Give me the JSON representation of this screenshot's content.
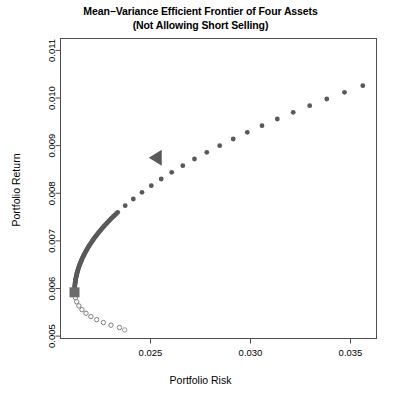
{
  "chart_data": {
    "type": "scatter",
    "title_line1": "Mean−Variance Efficient Frontier of Four Assets",
    "title_line2": "(Not Allowing Short Selling)",
    "xlabel": "Portfolio Risk",
    "ylabel": "Portfolio Return",
    "xlim": [
      0.0205,
      0.0363
    ],
    "ylim": [
      0.00495,
      0.01125
    ],
    "xticks": [
      0.025,
      0.03,
      0.035
    ],
    "xtick_labels": [
      "0.025",
      "0.030",
      "0.035"
    ],
    "yticks": [
      0.005,
      0.006,
      0.007,
      0.008,
      0.009,
      0.01,
      0.011
    ],
    "ytick_labels": [
      "0.005",
      "0.006",
      "0.007",
      "0.008",
      "0.009",
      "0.010",
      "0.011"
    ],
    "grid": false,
    "legend": "none",
    "marker_color": "#595959",
    "frame_color": "#4d4d4d",
    "series": [
      {
        "name": "Efficient frontier",
        "marker": "filled-circle",
        "color": "#595959",
        "points": [
          [
            0.0212,
            0.00592
          ],
          [
            0.021215,
            0.00606
          ],
          [
            0.02126,
            0.0062
          ],
          [
            0.021335,
            0.00634
          ],
          [
            0.02144,
            0.00648
          ],
          [
            0.021575,
            0.00662
          ],
          [
            0.02174,
            0.00676
          ],
          [
            0.021935,
            0.0069
          ],
          [
            0.02216,
            0.00704
          ],
          [
            0.022415,
            0.00718
          ],
          [
            0.0227,
            0.00732
          ],
          [
            0.023015,
            0.00746
          ],
          [
            0.02336,
            0.0076
          ],
          [
            0.023735,
            0.00774
          ],
          [
            0.02414,
            0.00788
          ],
          [
            0.024575,
            0.00802
          ],
          [
            0.02504,
            0.00816
          ],
          [
            0.025535,
            0.0083
          ],
          [
            0.02606,
            0.00844
          ],
          [
            0.026615,
            0.00858
          ],
          [
            0.0272,
            0.00872
          ],
          [
            0.027815,
            0.00886
          ],
          [
            0.02846,
            0.009
          ],
          [
            0.029135,
            0.00914
          ],
          [
            0.02984,
            0.00928
          ],
          [
            0.030575,
            0.00942
          ],
          [
            0.03134,
            0.00956
          ],
          [
            0.032135,
            0.0097
          ],
          [
            0.03296,
            0.00984
          ],
          [
            0.033815,
            0.00998
          ],
          [
            0.0347,
            0.01012
          ],
          [
            0.035615,
            0.01026
          ]
        ]
      },
      {
        "name": "Inefficient lower branch",
        "marker": "open-circle",
        "color": "#808080",
        "points": [
          [
            0.021245,
            0.00581
          ],
          [
            0.02131,
            0.00572
          ],
          [
            0.02142,
            0.005635
          ],
          [
            0.021575,
            0.005555
          ],
          [
            0.021775,
            0.00548
          ],
          [
            0.02202,
            0.00541
          ],
          [
            0.02231,
            0.005345
          ],
          [
            0.022645,
            0.005285
          ],
          [
            0.023025,
            0.00523
          ],
          [
            0.02345,
            0.00518
          ]
        ]
      },
      {
        "name": "Isolated asset point",
        "marker": "open-circle",
        "color": "#9a9a9a",
        "points": [
          [
            0.02371,
            0.00513
          ]
        ]
      }
    ],
    "annotations": [
      {
        "name": "minimum-variance-portfolio",
        "marker": "filled-square",
        "color": "#6b6b6b",
        "x": 0.0212,
        "y": 0.00592,
        "size": 10
      },
      {
        "name": "tangency-portfolio",
        "marker": "left-triangle",
        "color": "#595959",
        "x": 0.02527,
        "y": 0.008745,
        "size": 13
      }
    ]
  }
}
